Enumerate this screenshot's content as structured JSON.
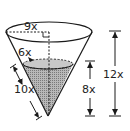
{
  "figure": {
    "labels": {
      "top_radius": "9x",
      "water_radius": "6x",
      "slant_water": "10x",
      "water_height": "8x",
      "cone_height": "12x"
    },
    "colors": {
      "stroke": "#1a1a1a",
      "water_fill": "#a9a9a9",
      "background": "#ffffff"
    }
  }
}
